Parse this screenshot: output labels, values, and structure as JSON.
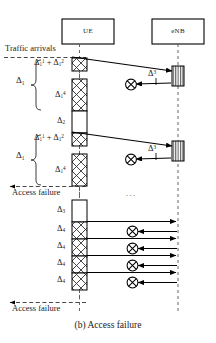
{
  "figure": {
    "caption": "(b) Access failure",
    "ellipsis": "...",
    "entities": [
      {
        "name": "UE",
        "label": "UE"
      },
      {
        "name": "eNB",
        "label": "eNB"
      }
    ],
    "annotations": {
      "traffic_arrivals": "Traffic arrivals",
      "access_failure_1": "Access failure",
      "access_failure_2": "Access failure"
    },
    "braces": [
      {
        "label_base": "Δ",
        "label_sub": "1",
        "label": "Δ1"
      },
      {
        "label_base": "Δ",
        "label_sub": "1",
        "label": "Δ1"
      }
    ],
    "ue_segments": [
      {
        "id": "seg-1",
        "base": "Δ",
        "sub": "1",
        "sup": "1",
        "extra": "+",
        "base2": "Δ",
        "sub2": "1",
        "sup2": "2",
        "pattern": "cross-hatch",
        "text": "Δ1¹ + Δ1²"
      },
      {
        "id": "seg-2",
        "base": "Δ",
        "sub": "1",
        "sup": "4",
        "pattern": "cross-hatch",
        "text": "Δ1⁴"
      },
      {
        "id": "seg-3",
        "base": "Δ",
        "sub": "2",
        "sup": "",
        "pattern": "plain",
        "text": "Δ2"
      },
      {
        "id": "seg-4",
        "base": "Δ",
        "sub": "1",
        "sup": "1",
        "extra": "+",
        "base2": "Δ",
        "sub2": "1",
        "sup2": "2",
        "pattern": "cross-hatch",
        "text": "Δ1¹ + Δ1²"
      },
      {
        "id": "seg-5",
        "base": "Δ",
        "sub": "1",
        "sup": "4",
        "pattern": "cross-hatch",
        "text": "Δ1⁴"
      },
      {
        "id": "seg-6",
        "base": "Δ",
        "sub": "3",
        "sup": "",
        "pattern": "plain",
        "text": "Δ3"
      },
      {
        "id": "seg-7",
        "base": "Δ",
        "sub": "4",
        "sup": "",
        "pattern": "cross-hatch",
        "text": "Δ4"
      },
      {
        "id": "seg-8",
        "base": "Δ",
        "sub": "4",
        "sup": "",
        "pattern": "cross-hatch",
        "text": "Δ4"
      },
      {
        "id": "seg-9",
        "base": "Δ",
        "sub": "4",
        "sup": "",
        "pattern": "cross-hatch",
        "text": "Δ4"
      },
      {
        "id": "seg-10",
        "base": "Δ",
        "sub": "4",
        "sup": "",
        "pattern": "cross-hatch",
        "text": "Δ4"
      }
    ],
    "enb_segments": [
      {
        "id": "enb-1",
        "base": "Δ",
        "sup": "3",
        "pattern": "v-hatch",
        "text": "Δ3"
      },
      {
        "id": "enb-2",
        "base": "Δ",
        "sup": "3",
        "pattern": "v-hatch",
        "text": "Δ3"
      }
    ],
    "collision_markers": 6,
    "colors": {
      "line": "#000000",
      "background": "#ffffff",
      "hatch": "#333333",
      "dashed": "#444444"
    }
  }
}
